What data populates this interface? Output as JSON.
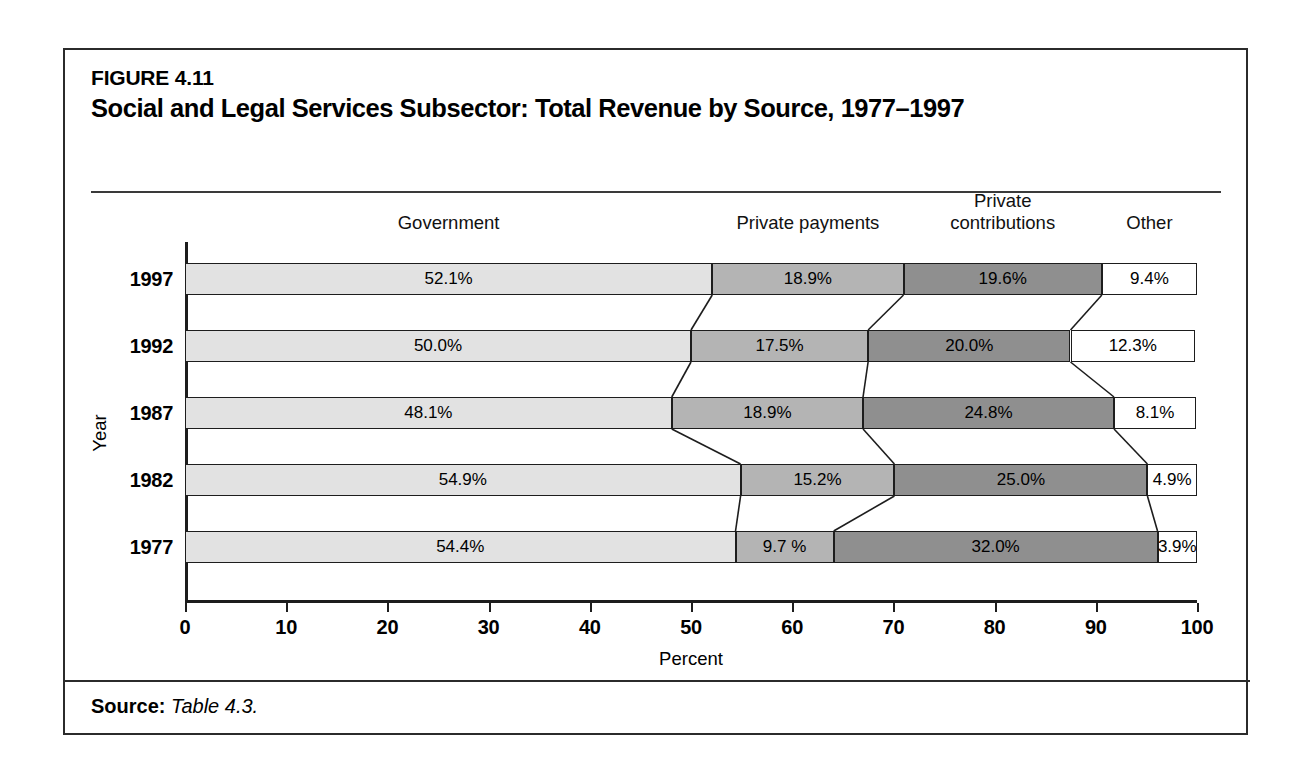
{
  "figure": {
    "label": "FIGURE 4.11",
    "title": "Social and Legal Services Subsector: Total Revenue by Source, 1977–1997",
    "source_label": "Source:",
    "source_value": "Table 4.3."
  },
  "chart_data": {
    "type": "bar",
    "orientation": "horizontal",
    "stacked": true,
    "normalized_percent": true,
    "title": "Social and Legal Services Subsector: Total Revenue by Source, 1977–1997",
    "xlabel": "Percent",
    "ylabel": "Year",
    "xlim": [
      0,
      100
    ],
    "xticks": [
      "0",
      "10",
      "20",
      "30",
      "40",
      "50",
      "60",
      "70",
      "80",
      "90",
      "100"
    ],
    "grid": false,
    "legend_position": "top-above-columns",
    "categories": [
      "1997",
      "1992",
      "1987",
      "1982",
      "1977"
    ],
    "series": [
      {
        "name": "Government",
        "color": "#e2e2e2",
        "values": [
          52.1,
          50.0,
          48.1,
          54.9,
          54.4
        ],
        "labels": [
          "52.1%",
          "50.0%",
          "48.1%",
          "54.9%",
          "54.4%"
        ]
      },
      {
        "name": "Private payments",
        "color": "#b4b4b4",
        "values": [
          18.9,
          17.5,
          18.9,
          15.2,
          9.7
        ],
        "labels": [
          "18.9%",
          "17.5%",
          "18.9%",
          "15.2%",
          "9.7 %"
        ]
      },
      {
        "name": "Private contributions",
        "color": "#8f8f8f",
        "values": [
          19.6,
          20.0,
          24.8,
          25.0,
          32.0
        ],
        "labels": [
          "19.6%",
          "20.0%",
          "24.8%",
          "25.0%",
          "32.0%"
        ]
      },
      {
        "name": "Other",
        "color": "#ffffff",
        "values": [
          9.4,
          12.3,
          8.1,
          4.9,
          3.9
        ],
        "labels": [
          "9.4%",
          "12.3%",
          "8.1%",
          "4.9%",
          "3.9%"
        ]
      }
    ],
    "column_headers": [
      "Government",
      "Private payments",
      "Private\ncontributions",
      "Other"
    ]
  }
}
